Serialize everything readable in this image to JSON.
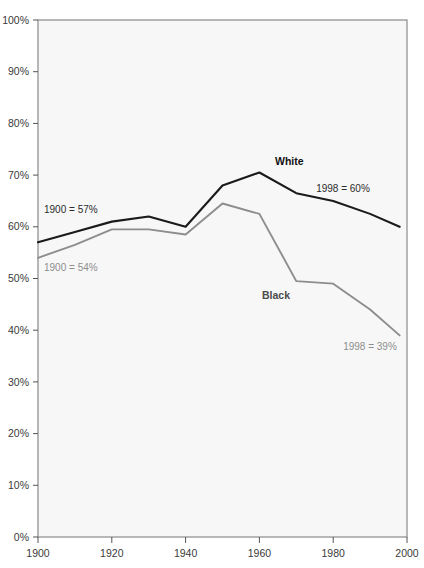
{
  "chart_data": {
    "type": "line",
    "title": "",
    "xlabel": "",
    "ylabel": "",
    "xlim": [
      1900,
      2000
    ],
    "ylim": [
      0,
      100
    ],
    "grid": false,
    "legend_position": "inline-annotations",
    "x_tick_labels": [
      "1900",
      "1920",
      "1940",
      "1960",
      "1980",
      "2000"
    ],
    "x_ticks": [
      1900,
      1920,
      1940,
      1960,
      1980,
      2000
    ],
    "y_tick_labels": [
      "0%",
      "10%",
      "20%",
      "30%",
      "40%",
      "50%",
      "60%",
      "70%",
      "80%",
      "90%",
      "100%"
    ],
    "y_ticks": [
      0,
      10,
      20,
      30,
      40,
      50,
      60,
      70,
      80,
      90,
      100
    ],
    "x": [
      1900,
      1910,
      1920,
      1930,
      1940,
      1950,
      1960,
      1970,
      1980,
      1990,
      1998
    ],
    "series": [
      {
        "name": "White",
        "color": "#1a1a1a",
        "values": [
          57,
          59,
          61,
          62,
          60,
          68,
          70.5,
          66.5,
          65,
          62.5,
          60
        ]
      },
      {
        "name": "Black",
        "color": "#8d8d8d",
        "values": [
          54,
          56.5,
          59.5,
          59.5,
          58.5,
          64.5,
          62.5,
          49.5,
          49,
          44,
          39
        ]
      }
    ],
    "annotations": [
      {
        "id": "white-start",
        "text": "1900 = 57%",
        "style": "dark"
      },
      {
        "id": "black-start",
        "text": "1900 = 54%",
        "style": "gray"
      },
      {
        "id": "white-end",
        "text": "1998 = 60%",
        "style": "dark"
      },
      {
        "id": "black-end",
        "text": "1998 = 39%",
        "style": "gray"
      },
      {
        "id": "white-series-label",
        "text": "White",
        "style": "dark-bold"
      },
      {
        "id": "black-series-label",
        "text": "Black",
        "style": "gray-bold"
      }
    ],
    "plot_area": {
      "left": 38,
      "top": 20,
      "right": 407,
      "bottom": 537
    },
    "colors": {
      "plot_background": "#f7f7f7",
      "plot_border": "#8a8a8a",
      "white_series": "#1a1a1a",
      "black_series": "#8d8d8d",
      "tick_label": "#3a3a3a"
    }
  }
}
